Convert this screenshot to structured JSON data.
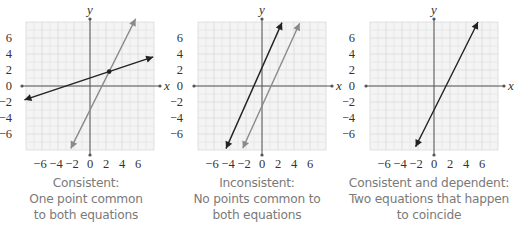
{
  "chart_data": [
    {
      "type": "line",
      "title": "Consistent:",
      "caption_lines": [
        "Consistent:",
        "One point common",
        "to both equations"
      ],
      "xlabel": "x",
      "ylabel": "y",
      "xlim": [
        -8,
        8
      ],
      "ylim": [
        -8,
        8
      ],
      "grid": true,
      "x_ticks": [
        -6,
        -4,
        -2,
        0,
        2,
        4,
        6
      ],
      "y_ticks": [
        6,
        4,
        2,
        0,
        -2,
        -4,
        -6
      ],
      "series": [
        {
          "name": "line-black",
          "color": "#222222",
          "slope": 0.333,
          "intercept": 1.0,
          "x_range": [
            -8.2,
            7.9
          ]
        },
        {
          "name": "line-gray",
          "color": "#8a8a8a",
          "slope": 2.0,
          "intercept": -3.0,
          "x_range": [
            -2.4,
            5.7
          ]
        }
      ],
      "points": [
        {
          "x": 2.4,
          "y": 1.8,
          "label": "intersection"
        }
      ]
    },
    {
      "type": "line",
      "title": "Inconsistent:",
      "caption_lines": [
        "Inconsistent:",
        "No points common to",
        "both equations"
      ],
      "xlabel": "x",
      "ylabel": "y",
      "xlim": [
        -8,
        8
      ],
      "ylim": [
        -8,
        8
      ],
      "grid": true,
      "x_ticks": [
        -6,
        -4,
        -2,
        0,
        2,
        4,
        6
      ],
      "y_ticks": [
        6,
        4,
        2,
        0,
        -2,
        -4,
        -6
      ],
      "series": [
        {
          "name": "line-black",
          "color": "#222222",
          "slope": 2.25,
          "intercept": 2.3,
          "x_range": [
            -4.5,
            2.5
          ]
        },
        {
          "name": "line-gray",
          "color": "#8a8a8a",
          "slope": 2.2,
          "intercept": -2.5,
          "x_range": [
            -2.4,
            4.7
          ]
        }
      ],
      "points": []
    },
    {
      "type": "line",
      "title": "Consistent and dependent:",
      "caption_lines": [
        "Consistent and dependent:",
        "Two equations that happen",
        "to coincide"
      ],
      "xlabel": "x",
      "ylabel": "y",
      "xlim": [
        -8,
        8
      ],
      "ylim": [
        -8,
        8
      ],
      "grid": true,
      "x_ticks": [
        -6,
        -4,
        -2,
        0,
        2,
        4,
        6
      ],
      "y_ticks": [
        6,
        4,
        2,
        0,
        -2,
        -4,
        -6
      ],
      "series": [
        {
          "name": "line-black",
          "color": "#222222",
          "slope": 2.0,
          "intercept": -3.0,
          "x_range": [
            -2.3,
            5.5
          ]
        }
      ],
      "points": []
    }
  ],
  "tick_labels": {
    "x": [
      "−6",
      "−4",
      "−2",
      "0",
      "2",
      "4",
      "6"
    ],
    "y": [
      "6",
      "4",
      "2",
      "0",
      "−2",
      "−4",
      "−6"
    ]
  },
  "axis_labels": {
    "x": "x",
    "y": "y"
  },
  "colors": {
    "grid_bg": "#f4f4f4",
    "grid_line": "#dcdcdc",
    "axis": "#555555",
    "line_dark": "#222222",
    "line_gray": "#8a8a8a",
    "caption": "#7a7a7a"
  }
}
